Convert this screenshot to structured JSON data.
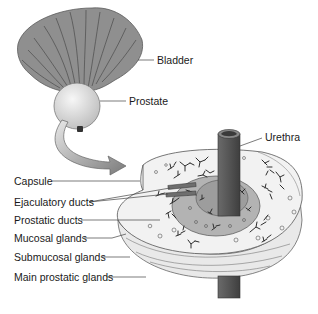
{
  "figure": {
    "colors": {
      "bladder": "#8f8f8f",
      "bladder_lines": "#4a4a4a",
      "prostate": "#dcdcdc",
      "urethra": "#555555",
      "arrow": "#9a9a9a",
      "section_fill": "#efefef",
      "inner_zone": "#a8a8a8",
      "glands": "#2e2e2e",
      "leader_lines": "#444444"
    },
    "labels": {
      "bladder": "Bladder",
      "prostate": "Prostate",
      "urethra": "Urethra",
      "capsule": "Capsule",
      "ejaculatory_ducts": "Ejaculatory ducts",
      "prostatic_ducts": "Prostatic ducts",
      "mucosal_glands": "Mucosal glands",
      "submucosal_glands": "Submucosal glands",
      "main_prostatic_glands": "Main prostatic glands"
    }
  }
}
